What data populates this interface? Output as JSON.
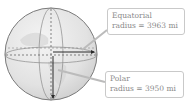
{
  "diagram": {
    "labels": {
      "equatorial": {
        "title": "Equatorial",
        "value_line": "radius = 3963 mi",
        "radius_mi": 3963
      },
      "polar": {
        "title": "Polar",
        "value_line": "radius = 3950 mi",
        "radius_mi": 3950
      }
    },
    "colors": {
      "sphere_fill": "#e6e6e6",
      "sphere_outline": "#7a7a7a",
      "arrow": "#2a2a2a",
      "label_text": "#8a8a8a",
      "label_border": "#c9c9c9"
    }
  }
}
